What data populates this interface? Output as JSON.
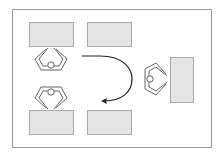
{
  "diagram": {
    "colors": {
      "frame": "#9a9a9a",
      "table_fill": "#e4e4e4",
      "table_stroke": "#a8a8a8",
      "person_stroke": "#555555",
      "arrow": "#222222"
    },
    "tables": [
      {
        "id": "table-top-left",
        "orientation": "horizontal"
      },
      {
        "id": "table-top-right",
        "orientation": "horizontal"
      },
      {
        "id": "table-bottom-left",
        "orientation": "horizontal"
      },
      {
        "id": "table-bottom-right",
        "orientation": "horizontal"
      },
      {
        "id": "table-right",
        "orientation": "vertical"
      }
    ],
    "persons": [
      {
        "id": "person-top-left",
        "facing": "up"
      },
      {
        "id": "person-bottom-left",
        "facing": "down"
      },
      {
        "id": "person-right",
        "facing": "right"
      }
    ],
    "arrow": {
      "id": "rotation-arrow",
      "direction": "clockwise-u-turn"
    }
  }
}
